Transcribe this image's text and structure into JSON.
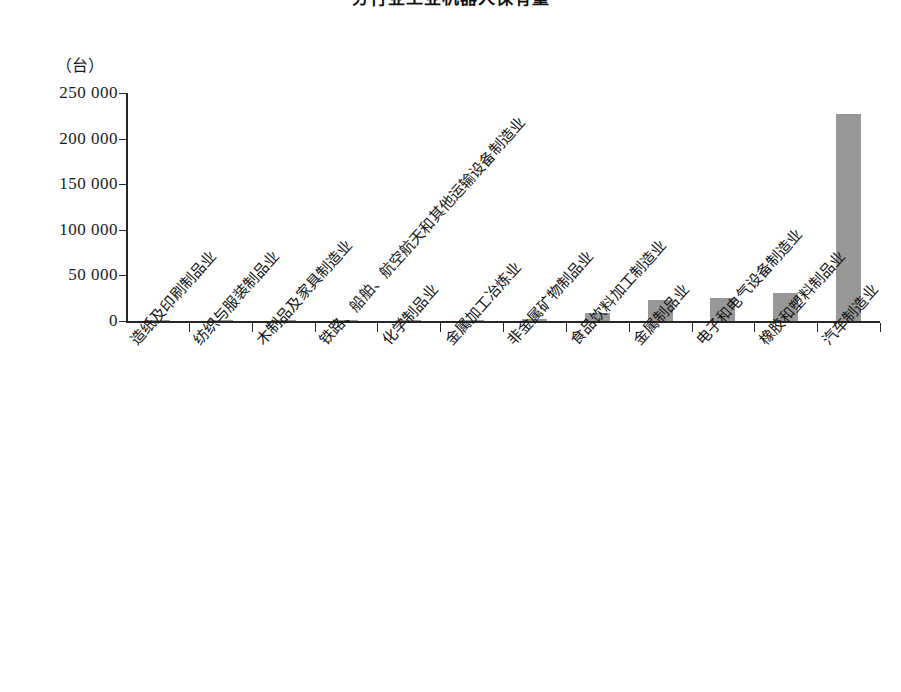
{
  "chart_data": {
    "type": "bar",
    "title": "分行业工业机器人保有量",
    "subtitle": "",
    "xlabel": "",
    "ylabel": "",
    "unit_label": "（台）",
    "grid": false,
    "legend": null,
    "ylim": [
      0,
      250000
    ],
    "ytick_labels": [
      "250 000",
      "200 000",
      "150 000",
      "100 000",
      "50 000",
      "0"
    ],
    "ytick_values": [
      250000,
      200000,
      150000,
      100000,
      50000,
      0
    ],
    "categories": [
      "造纸及印刷制品业",
      "纺织与服装制品业",
      "木制品及家具制造业",
      "铁路、船舶、航空航天和其他运输设备制造业",
      "化学制品业",
      "金属加工冶炼业",
      "非金属矿物制品业",
      "食品饮料加工制造业",
      "金属制品业",
      "电子和电气设备制造业",
      "橡胶和塑料制品业",
      "汽车制造业"
    ],
    "values": [
      300,
      400,
      500,
      1400,
      1500,
      1200,
      1800,
      9000,
      23500,
      25500,
      30500,
      226500
    ],
    "bar_color": "#989898",
    "axis_color": "#262626"
  }
}
